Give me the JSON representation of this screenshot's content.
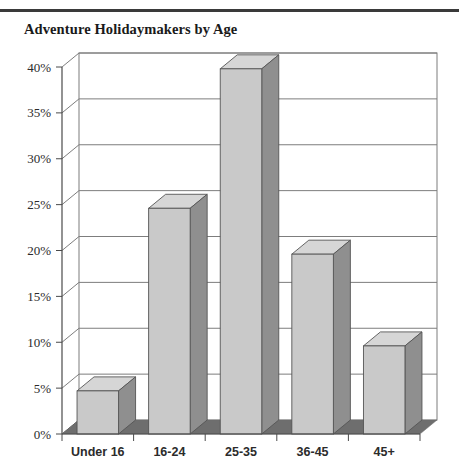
{
  "header": {
    "title": "Adventure Holidaymakers by Age"
  },
  "chart_data": {
    "type": "bar",
    "title": "Adventure Holidaymakers by Age",
    "xlabel": "",
    "ylabel": "",
    "categories": [
      "Under 16",
      "16-24",
      "25-35",
      "36-45",
      "45+"
    ],
    "values": [
      4.7,
      24.6,
      39.8,
      19.6,
      9.6
    ],
    "value_labels": [
      "4.7%",
      "24.6%",
      "39.8%",
      "19.6%",
      "9.6%"
    ],
    "ylim": [
      0,
      40
    ],
    "ytick_values": [
      0,
      5,
      10,
      15,
      20,
      25,
      30,
      35,
      40
    ],
    "ytick_labels": [
      "0%",
      "5%",
      "10%",
      "15%",
      "20%",
      "25%",
      "30%",
      "35%",
      "40%"
    ],
    "grid": true,
    "grid_axis": "y",
    "legend": false,
    "legend_position": "none",
    "style": "3d-column",
    "series": [
      {
        "name": "Adventure Holidaymakers",
        "values": [
          4.7,
          24.6,
          39.8,
          19.6,
          9.6
        ]
      }
    ]
  },
  "colors": {
    "bar_face": "#c9c9c9",
    "bar_side": "#8f8f8f",
    "bar_top": "#d6d6d6",
    "floor": "#6e6e6e",
    "grid": "#7d7d7d",
    "axis": "#4a4a4a",
    "text": "#2b2b2b",
    "rule": "#3a3a3a",
    "background": "#ffffff"
  }
}
